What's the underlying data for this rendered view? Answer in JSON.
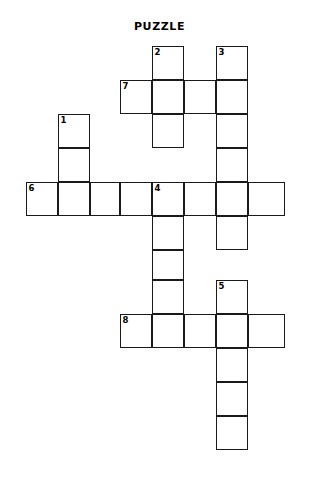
{
  "page": {
    "title": "PUZZLE",
    "background_color": "#ffffff",
    "line_color": "#1a1a1a",
    "width": 319,
    "height": 477
  },
  "grid": {
    "cell_size": 32,
    "origin_x": 26,
    "origin_y": 46,
    "columns": 8,
    "rows": 13,
    "column_x": [
      26,
      58,
      90,
      120,
      152,
      184,
      216,
      248,
      285
    ],
    "row_y": [
      46,
      80,
      114,
      148,
      182,
      216,
      250,
      280,
      314,
      348,
      382,
      416,
      450
    ]
  },
  "chart_data": {
    "type": "table",
    "title": "PUZZLE",
    "cells": [
      {
        "col": 4,
        "row": 0,
        "number": "2",
        "letter": ""
      },
      {
        "col": 6,
        "row": 0,
        "number": "3",
        "letter": ""
      },
      {
        "col": 3,
        "row": 1,
        "number": "7",
        "letter": ""
      },
      {
        "col": 4,
        "row": 1,
        "number": "",
        "letter": ""
      },
      {
        "col": 5,
        "row": 1,
        "number": "",
        "letter": ""
      },
      {
        "col": 6,
        "row": 1,
        "number": "",
        "letter": ""
      },
      {
        "col": 4,
        "row": 2,
        "number": "",
        "letter": ""
      },
      {
        "col": 6,
        "row": 2,
        "number": "",
        "letter": ""
      },
      {
        "col": 1,
        "row": 2,
        "number": "1",
        "letter": ""
      },
      {
        "col": 1,
        "row": 3,
        "number": "",
        "letter": ""
      },
      {
        "col": 6,
        "row": 3,
        "number": "",
        "letter": ""
      },
      {
        "col": 0,
        "row": 4,
        "number": "6",
        "letter": ""
      },
      {
        "col": 1,
        "row": 4,
        "number": "",
        "letter": ""
      },
      {
        "col": 2,
        "row": 4,
        "number": "",
        "letter": ""
      },
      {
        "col": 3,
        "row": 4,
        "number": "",
        "letter": ""
      },
      {
        "col": 4,
        "row": 4,
        "number": "4",
        "letter": ""
      },
      {
        "col": 5,
        "row": 4,
        "number": "",
        "letter": ""
      },
      {
        "col": 6,
        "row": 4,
        "number": "",
        "letter": ""
      },
      {
        "col": 7,
        "row": 4,
        "number": "",
        "letter": ""
      },
      {
        "col": 4,
        "row": 5,
        "number": "",
        "letter": ""
      },
      {
        "col": 6,
        "row": 5,
        "number": "",
        "letter": ""
      },
      {
        "col": 4,
        "row": 6,
        "number": "",
        "letter": ""
      },
      {
        "col": 4,
        "row": 7,
        "number": "",
        "letter": ""
      },
      {
        "col": 6,
        "row": 7,
        "number": "5",
        "letter": ""
      },
      {
        "col": 3,
        "row": 8,
        "number": "8",
        "letter": ""
      },
      {
        "col": 4,
        "row": 8,
        "number": "",
        "letter": ""
      },
      {
        "col": 5,
        "row": 8,
        "number": "",
        "letter": ""
      },
      {
        "col": 6,
        "row": 8,
        "number": "",
        "letter": ""
      },
      {
        "col": 7,
        "row": 8,
        "number": "",
        "letter": ""
      },
      {
        "col": 6,
        "row": 9,
        "number": "",
        "letter": ""
      },
      {
        "col": 6,
        "row": 10,
        "number": "",
        "letter": ""
      },
      {
        "col": 6,
        "row": 11,
        "number": "",
        "letter": ""
      }
    ],
    "numbered_clues": [
      "1",
      "2",
      "3",
      "4",
      "5",
      "6",
      "7",
      "8"
    ],
    "across_starts": [
      "6",
      "7",
      "8"
    ],
    "down_starts": [
      "1",
      "2",
      "3",
      "4",
      "5"
    ]
  }
}
